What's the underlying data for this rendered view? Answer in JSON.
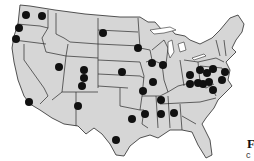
{
  "map": {
    "title": "United States",
    "background_color": "#ffffff",
    "land_color": "#d6d6d6",
    "border_color": "#2a2a2a",
    "marker_color": "#111111",
    "marker_shape": "filled-circle",
    "markers": [
      {
        "region": "Washington",
        "x": 26,
        "y": 15
      },
      {
        "region": "Washington",
        "x": 42,
        "y": 16
      },
      {
        "region": "Oregon",
        "x": 19,
        "y": 28
      },
      {
        "region": "Oregon",
        "x": 16,
        "y": 39
      },
      {
        "region": "Southern California",
        "x": 29,
        "y": 102
      },
      {
        "region": "North Dakota",
        "x": 103,
        "y": 33
      },
      {
        "region": "Utah",
        "x": 59,
        "y": 67
      },
      {
        "region": "Colorado",
        "x": 84,
        "y": 70
      },
      {
        "region": "Colorado",
        "x": 84,
        "y": 78
      },
      {
        "region": "Colorado",
        "x": 82,
        "y": 86
      },
      {
        "region": "Kansas",
        "x": 122,
        "y": 72
      },
      {
        "region": "New Mexico",
        "x": 78,
        "y": 106
      },
      {
        "region": "Texas",
        "x": 116,
        "y": 140
      },
      {
        "region": "Oklahoma/Texas",
        "x": 132,
        "y": 119
      },
      {
        "region": "Minnesota",
        "x": 138,
        "y": 48
      },
      {
        "region": "Iowa",
        "x": 152,
        "y": 63
      },
      {
        "region": "Illinois",
        "x": 163,
        "y": 65
      },
      {
        "region": "Missouri",
        "x": 153,
        "y": 82
      },
      {
        "region": "Missouri",
        "x": 143,
        "y": 91
      },
      {
        "region": "Kentucky",
        "x": 161,
        "y": 100
      },
      {
        "region": "Arkansas",
        "x": 145,
        "y": 114
      },
      {
        "region": "Mississippi",
        "x": 161,
        "y": 114
      },
      {
        "region": "Alabama",
        "x": 174,
        "y": 113
      },
      {
        "region": "Indiana",
        "x": 190,
        "y": 75
      },
      {
        "region": "Ohio",
        "x": 200,
        "y": 70
      },
      {
        "region": "Ohio",
        "x": 207,
        "y": 73
      },
      {
        "region": "Ohio",
        "x": 198,
        "y": 83
      },
      {
        "region": "Ohio",
        "x": 203,
        "y": 84
      },
      {
        "region": "West Virginia",
        "x": 209,
        "y": 82
      },
      {
        "region": "Virginia",
        "x": 213,
        "y": 90
      },
      {
        "region": "Pennsylvania",
        "x": 213,
        "y": 69
      },
      {
        "region": "New Jersey",
        "x": 225,
        "y": 72
      },
      {
        "region": "Maryland",
        "x": 222,
        "y": 80
      },
      {
        "region": "Tennessee",
        "x": 190,
        "y": 84
      }
    ],
    "marker_count": 34
  },
  "caption": {
    "heading_fragment": "F",
    "subtext_fragment": "c"
  }
}
